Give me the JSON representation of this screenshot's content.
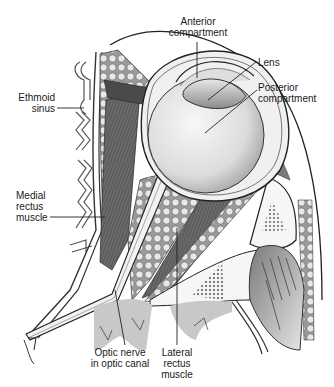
{
  "diagram": {
    "type": "anatomical-illustration",
    "colors": {
      "background": "#ffffff",
      "outline": "#2a2a2a",
      "muscle": "#5a5a5a",
      "fat": "#d8d8d8",
      "bone": "#eeeeee",
      "eyeball": "#e4e4e4"
    },
    "labels": {
      "anterior_compartment": {
        "line1": "Anterior",
        "line2": "compartment"
      },
      "lens": {
        "line1": "Lens"
      },
      "posterior_compartment": {
        "line1": "Posterior",
        "line2": "compartment"
      },
      "ethmoid_sinus": {
        "line1": "Ethmoid",
        "line2": "sinus"
      },
      "medial_rectus": {
        "line1": "Medial",
        "line2": "rectus",
        "line3": "muscle"
      },
      "optic_nerve": {
        "line1": "Optic nerve",
        "line2": "in optic canal"
      },
      "lateral_rectus": {
        "line1": "Lateral",
        "line2": "rectus",
        "line3": "muscle"
      }
    }
  }
}
